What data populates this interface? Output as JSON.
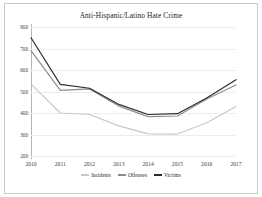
{
  "chart_data": {
    "type": "line",
    "title": "Anti-Hispanic/Latino Hate Crime",
    "xlabel": "",
    "ylabel": "",
    "categories": [
      "2010",
      "2011",
      "2012",
      "2013",
      "2014",
      "2015",
      "2016",
      "2017"
    ],
    "series": [
      {
        "name": "Incidents",
        "color": "#c8c8c8",
        "values": [
          534,
          400,
          393,
          340,
          303,
          302,
          355,
          430
        ]
      },
      {
        "name": "Offenses",
        "color": "#8c8c8c",
        "values": [
          690,
          505,
          512,
          432,
          383,
          386,
          465,
          530
        ]
      },
      {
        "name": "Victims",
        "color": "#2b2b2b",
        "values": [
          750,
          533,
          515,
          440,
          393,
          397,
          470,
          555
        ]
      }
    ],
    "ylim": [
      200,
      800
    ],
    "ytick_labels": [
      "800",
      "700",
      "600",
      "500",
      "400",
      "300",
      "200"
    ],
    "ytick_values": [
      800,
      700,
      600,
      500,
      400,
      300,
      200
    ],
    "grid": true,
    "grid_axis": "y",
    "legend_position": "bottom",
    "frame": true
  },
  "legend": {
    "items": [
      {
        "label": "Incidents",
        "color": "#c8c8c8"
      },
      {
        "label": "Offenses",
        "color": "#8c8c8c"
      },
      {
        "label": "Victims",
        "color": "#2b2b2b"
      }
    ]
  }
}
